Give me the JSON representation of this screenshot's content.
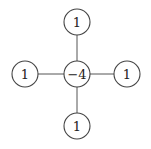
{
  "diagram": {
    "type": "laplacian-stencil",
    "center": {
      "label": "−4"
    },
    "top": {
      "label": "1"
    },
    "left": {
      "label": "1"
    },
    "right": {
      "label": "1"
    },
    "bottom": {
      "label": "1"
    },
    "colors": {
      "stroke": "#444444",
      "text": "#222222",
      "background": "#ffffff"
    }
  }
}
